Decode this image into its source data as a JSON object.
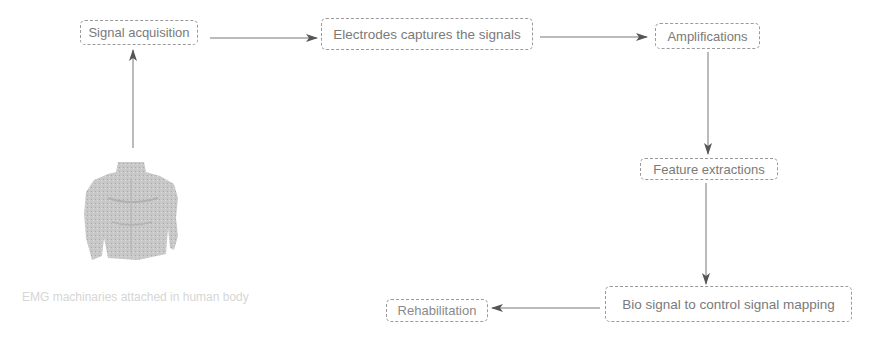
{
  "diagram": {
    "nodes": [
      {
        "id": "signal_acquisition",
        "label": "Signal acquisition"
      },
      {
        "id": "electrodes",
        "label": "Electrodes captures the signals"
      },
      {
        "id": "amplifications",
        "label": "Amplifications"
      },
      {
        "id": "feature_extractions",
        "label": "Feature extractions"
      },
      {
        "id": "mapping",
        "label": "Bio signal to control signal mapping"
      },
      {
        "id": "rehabilitation",
        "label": "Rehabilitation"
      }
    ],
    "edges": [
      {
        "from": "human_body",
        "to": "signal_acquisition"
      },
      {
        "from": "signal_acquisition",
        "to": "electrodes"
      },
      {
        "from": "electrodes",
        "to": "amplifications"
      },
      {
        "from": "amplifications",
        "to": "feature_extractions"
      },
      {
        "from": "feature_extractions",
        "to": "mapping"
      },
      {
        "from": "mapping",
        "to": "rehabilitation"
      }
    ],
    "image": {
      "icon": "human-torso-icon",
      "caption": "EMG machinaries attached in human body"
    }
  },
  "colors": {
    "stroke": "#6a6a6a",
    "border": "#9a9a9a",
    "text": "#7a7a7a",
    "caption": "#d6d6d6",
    "torso": "#c4c4c4"
  }
}
